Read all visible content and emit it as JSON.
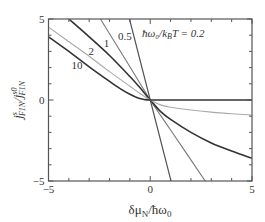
{
  "chart_data": {
    "type": "line",
    "title": "",
    "xlabel": "δμ_N/ħω_0",
    "ylabel": "j^s_F1N/j^s0_F1N",
    "xlim": [
      -5,
      5
    ],
    "ylim": [
      -5,
      5
    ],
    "xticks": [
      -5,
      0,
      5
    ],
    "yticks": [
      -5,
      0,
      5
    ],
    "xtick_labels": [
      "−5",
      "0",
      "5"
    ],
    "ytick_labels": [
      "−5",
      "0",
      "5"
    ],
    "grid": false,
    "legend": "none (inline curve labels)",
    "annotation": "ħω0/kBT = 0.2",
    "series": [
      {
        "name": "0.2",
        "color": "#555555",
        "width": 1.2,
        "x": [
          -1.02,
          0,
          1.02
        ],
        "y": [
          5,
          0,
          -5
        ]
      },
      {
        "name": "0.5",
        "color": "#777777",
        "width": 1.1,
        "x": [
          -2.45,
          -1,
          0,
          1,
          2.7
        ],
        "y": [
          5,
          2.05,
          0,
          -1.85,
          -5
        ]
      },
      {
        "name": "1",
        "color": "#333333",
        "width": 1.6,
        "x": [
          -4.0,
          -3,
          -2,
          -1,
          -0.5,
          0,
          0.5,
          1,
          2,
          3,
          4,
          5
        ],
        "y": [
          5,
          3.9,
          2.75,
          1.45,
          0.75,
          0,
          -0.7,
          -1.2,
          -2.0,
          -2.65,
          -3.15,
          -3.6
        ]
      },
      {
        "name": "2",
        "color": "#aaaaaa",
        "width": 1.1,
        "x": [
          -5,
          -4,
          -3,
          -2,
          -1,
          -0.5,
          0,
          0.5,
          1,
          2,
          3,
          4,
          5
        ],
        "y": [
          4.5,
          3.6,
          2.7,
          1.75,
          0.85,
          0.4,
          0,
          -0.3,
          -0.45,
          -0.62,
          -0.75,
          -0.85,
          -0.93
        ]
      },
      {
        "name": "10",
        "color": "#333333",
        "width": 1.6,
        "x": [
          -5,
          -4,
          -3,
          -2,
          -1.5,
          -1,
          -0.6,
          -0.3,
          0,
          1,
          2,
          3,
          4,
          5
        ],
        "y": [
          3.9,
          3.0,
          2.05,
          1.15,
          0.72,
          0.35,
          0.12,
          0.03,
          0,
          0,
          0,
          0,
          0,
          0
        ]
      }
    ],
    "curve_labels": [
      {
        "text": "10",
        "x": -3.6,
        "y": 1.9
      },
      {
        "text": "2",
        "x": -2.9,
        "y": 2.8
      },
      {
        "text": "1",
        "x": -2.15,
        "y": 3.3
      },
      {
        "text": "0.5",
        "x": -1.25,
        "y": 3.7
      }
    ]
  },
  "labels": {
    "annotation": "ħω₀/k",
    "annotation_sub": "B",
    "annotation_rest": "T = 0.2",
    "xlabel_main": "δμ",
    "xlabel_sub": "N",
    "xlabel_rest": "/ħω",
    "xlabel_sub2": "0",
    "ylabel_j": "j",
    "ylabel_sup": "s",
    "ylabel_sub": "F1N",
    "ylabel_slash": "/j",
    "ylabel_sup2": "s0",
    "ylabel_sub2": "F1N"
  }
}
